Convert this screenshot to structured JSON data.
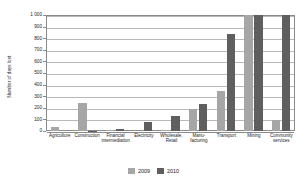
{
  "chart_data": {
    "type": "bar",
    "title": "",
    "xlabel": "",
    "ylabel": "Number of days lost",
    "ylim": [
      0,
      1000
    ],
    "ytick_labels": [
      "1 000",
      "900",
      "800",
      "700",
      "600",
      "500",
      "400",
      "300",
      "200",
      "100",
      "0"
    ],
    "ytick_values": [
      1000,
      900,
      800,
      700,
      600,
      500,
      400,
      300,
      200,
      100,
      0
    ],
    "grid": true,
    "legend_position": "bottom-center",
    "categories": [
      "Agriculture",
      "Construction",
      "Financial intermediation",
      "Electricity",
      "Wholesale, Retail",
      "Manu-facturing",
      "Transport",
      "Mining",
      "Community services"
    ],
    "category_lines": [
      [
        "Agriculture"
      ],
      [
        "Construction"
      ],
      [
        "Financial",
        "intermediation"
      ],
      [
        "Electricity"
      ],
      [
        "Wholesale,",
        "Retail"
      ],
      [
        "Manu-",
        "facturing"
      ],
      [
        "Transport"
      ],
      [
        "Mining"
      ],
      [
        "Community",
        "services"
      ]
    ],
    "series": [
      {
        "name": "2009",
        "color": "#a6a6a6",
        "values": [
          35,
          245,
          5,
          0,
          8,
          190,
          345,
          1000,
          95
        ],
        "clipped": [
          false,
          false,
          false,
          false,
          false,
          false,
          false,
          true,
          false
        ]
      },
      {
        "name": "2010",
        "color": "#5f5f5f",
        "values": [
          0,
          3,
          15,
          75,
          130,
          230,
          840,
          1000,
          1000
        ],
        "clipped": [
          false,
          false,
          false,
          false,
          false,
          false,
          false,
          true,
          true
        ]
      }
    ]
  },
  "legend": {
    "items": [
      {
        "label": "2009",
        "color": "#a6a6a6"
      },
      {
        "label": "2010",
        "color": "#5f5f5f"
      }
    ]
  }
}
